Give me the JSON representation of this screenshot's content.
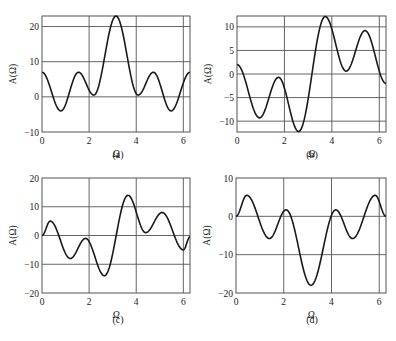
{
  "figure": {
    "x_axis_label": "Ω",
    "y_axis_label": "A(Ω)"
  },
  "chart_data": [
    {
      "type": "line",
      "caption": "(a)",
      "xlabel": "Ω",
      "ylabel": "A(Ω)",
      "xlim": [
        0,
        6.283
      ],
      "ylim": [
        -10,
        23
      ],
      "xticks": [
        0,
        2,
        4,
        6
      ],
      "yticks": [
        -10,
        0,
        10,
        20
      ],
      "grid": true,
      "frame": {
        "left": 42,
        "top": 16,
        "right": 190,
        "bottom": 132
      },
      "caption_pos": {
        "x": 118,
        "y": 158
      },
      "x": [
        0,
        0.8,
        1.55,
        2.2,
        3.14,
        4.08,
        4.73,
        5.48,
        6.283
      ],
      "values": [
        7,
        -4,
        7,
        0.5,
        23,
        0.5,
        7,
        -4,
        7
      ]
    },
    {
      "type": "line",
      "caption": "(b)",
      "xlabel": "Ω",
      "ylabel": "A(Ω)",
      "xlim": [
        0,
        6.283
      ],
      "ylim": [
        -12.3,
        12.3
      ],
      "xticks": [
        0,
        2,
        4,
        6
      ],
      "yticks": [
        -10,
        -5,
        0,
        5,
        10
      ],
      "grid": true,
      "frame": {
        "left": 237,
        "top": 16,
        "right": 386,
        "bottom": 132
      },
      "caption_pos": {
        "x": 312,
        "y": 158
      },
      "x": [
        0,
        0.95,
        1.75,
        2.6,
        3.72,
        4.6,
        5.4,
        6.283
      ],
      "values": [
        2,
        -9.3,
        -0.7,
        -12.2,
        12.2,
        0.6,
        9.2,
        -2
      ]
    },
    {
      "type": "line",
      "caption": "(c)",
      "xlabel": "Ω",
      "ylabel": "A(Ω)",
      "xlim": [
        0,
        6.283
      ],
      "ylim": [
        -20,
        20
      ],
      "xticks": [
        0,
        2,
        4,
        6
      ],
      "yticks": [
        -20,
        -10,
        0,
        10,
        20
      ],
      "grid": true,
      "frame": {
        "left": 42,
        "top": 178,
        "right": 190,
        "bottom": 293
      },
      "caption_pos": {
        "x": 118,
        "y": 323
      },
      "x": [
        0,
        0.35,
        1.2,
        1.85,
        2.65,
        3.65,
        4.4,
        5.1,
        6.0,
        6.283
      ],
      "values": [
        0,
        5,
        -8,
        -1,
        -14,
        14,
        1,
        8,
        -5,
        -0.5
      ]
    },
    {
      "type": "line",
      "caption": "(d)",
      "xlabel": "Ω",
      "ylabel": "A(Ω)",
      "xlim": [
        0,
        6.283
      ],
      "ylim": [
        -20,
        10
      ],
      "xticks": [
        0,
        2,
        4,
        6
      ],
      "yticks": [
        -20,
        -10,
        0,
        10
      ],
      "grid": true,
      "frame": {
        "left": 236,
        "top": 178,
        "right": 386,
        "bottom": 293
      },
      "caption_pos": {
        "x": 312,
        "y": 323
      },
      "x": [
        0,
        0.45,
        1.4,
        2.1,
        3.14,
        4.18,
        4.88,
        5.83,
        6.283
      ],
      "values": [
        0,
        5.5,
        -5.8,
        1.7,
        -18,
        1.7,
        -5.8,
        5.5,
        0
      ]
    }
  ]
}
